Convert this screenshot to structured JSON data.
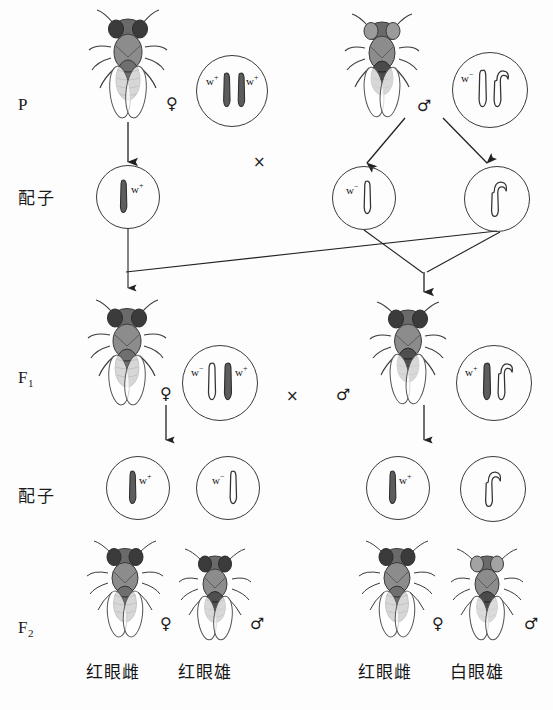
{
  "figure": {
    "organism": "Drosophila melanogaster",
    "ink_color": "#2f2f2f",
    "paper_color": "#fdfdfd"
  },
  "row_labels": {
    "p": "P",
    "gametes_1": "配子",
    "f1_main": "F",
    "f1_sub": "1",
    "gametes_2": "配子",
    "f2_main": "F",
    "f2_sub": "2"
  },
  "symbols": {
    "female": "♀",
    "male": "♂",
    "cross": "×",
    "allele_wild": "w",
    "allele_wild_sup": "+",
    "allele_mutant": "w",
    "allele_mutant_sup": "−"
  },
  "generations": [
    {
      "name": "P",
      "label": "P",
      "parents": [
        {
          "id": "p-female",
          "sex": "♀",
          "eye_color": "red",
          "genotype": "w+ / w+",
          "chromosomes": [
            {
              "type": "X",
              "allele": "w",
              "sup": "+",
              "fill": "dark",
              "label_side": "left"
            },
            {
              "type": "X",
              "allele": "w",
              "sup": "+",
              "fill": "dark",
              "label_side": "right"
            }
          ]
        },
        {
          "id": "p-male",
          "sex": "♂",
          "eye_color": "white",
          "genotype": "w- / Y",
          "chromosomes": [
            {
              "type": "X",
              "allele": "w",
              "sup": "−",
              "fill": "open",
              "label_side": "left"
            },
            {
              "type": "Y",
              "allele": "",
              "sup": "",
              "fill": "open",
              "label_side": "none"
            }
          ]
        }
      ]
    },
    {
      "name": "gametes-1",
      "label": "配子",
      "gametes": [
        {
          "id": "p-f-gamete-wplus",
          "type": "X",
          "allele": "w",
          "sup": "+",
          "fill": "dark",
          "label_side": "right"
        },
        {
          "id": "p-m-gamete-wminus",
          "type": "X",
          "allele": "w",
          "sup": "−",
          "fill": "open",
          "label_side": "left"
        },
        {
          "id": "p-m-gamete-y",
          "type": "Y",
          "allele": "",
          "sup": "",
          "fill": "open",
          "label_side": "none"
        }
      ]
    },
    {
      "name": "F1",
      "label": "F1",
      "parents": [
        {
          "id": "f1-female",
          "sex": "♀",
          "eye_color": "red",
          "genotype": "w- / w+",
          "chromosomes": [
            {
              "type": "X",
              "allele": "w",
              "sup": "−",
              "fill": "open",
              "label_side": "left"
            },
            {
              "type": "X",
              "allele": "w",
              "sup": "+",
              "fill": "dark",
              "label_side": "right"
            }
          ]
        },
        {
          "id": "f1-male",
          "sex": "♂",
          "eye_color": "red",
          "genotype": "w+ / Y",
          "chromosomes": [
            {
              "type": "X",
              "allele": "w",
              "sup": "+",
              "fill": "dark",
              "label_side": "left"
            },
            {
              "type": "Y",
              "allele": "",
              "sup": "",
              "fill": "open",
              "label_side": "none"
            }
          ]
        }
      ]
    },
    {
      "name": "gametes-2",
      "label": "配子",
      "gametes": [
        {
          "id": "f1-f-gamete-wplus",
          "type": "X",
          "allele": "w",
          "sup": "+",
          "fill": "dark",
          "label_side": "right"
        },
        {
          "id": "f1-f-gamete-wminus",
          "type": "X",
          "allele": "w",
          "sup": "−",
          "fill": "open",
          "label_side": "left"
        },
        {
          "id": "f1-m-gamete-wplus",
          "type": "X",
          "allele": "w",
          "sup": "+",
          "fill": "dark",
          "label_side": "right"
        },
        {
          "id": "f1-m-gamete-y",
          "type": "Y",
          "allele": "",
          "sup": "",
          "fill": "open",
          "label_side": "none"
        }
      ]
    },
    {
      "name": "F2",
      "label": "F2",
      "offspring": [
        {
          "id": "f2-1",
          "sex": "♀",
          "eye_color": "red",
          "caption": "红眼雌"
        },
        {
          "id": "f2-2",
          "sex": "♂",
          "eye_color": "red",
          "caption": "红眼雄"
        },
        {
          "id": "f2-3",
          "sex": "♀",
          "eye_color": "red",
          "caption": "红眼雌"
        },
        {
          "id": "f2-4",
          "sex": "♂",
          "eye_color": "white",
          "caption": "白眼雄"
        }
      ]
    }
  ],
  "f2_captions": [
    "红眼雌",
    "红眼雄",
    "红眼雌",
    "白眼雄"
  ]
}
